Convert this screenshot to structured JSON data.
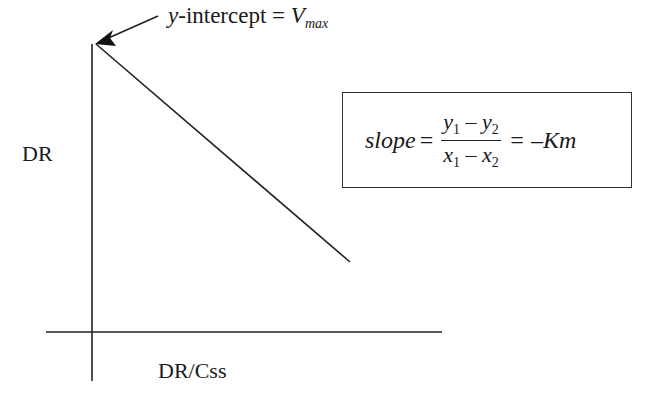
{
  "diagram": {
    "type": "linear-plot-sketch",
    "y_axis_label": "DR",
    "x_axis_label": "DR/Css",
    "annotation": {
      "prefix_var": "y",
      "text": "-intercept = ",
      "value_main": "V",
      "value_sub": "max"
    },
    "formula": {
      "lhs": "slope",
      "equals": "=",
      "num_a": "y",
      "num_a_sub": "1",
      "num_op": " – ",
      "num_b": "y",
      "num_b_sub": "2",
      "den_a": "x",
      "den_a_sub": "1",
      "den_op": " – ",
      "den_b": "x",
      "den_b_sub": "2",
      "rhs": "= –Km"
    },
    "line": {
      "x1": 96,
      "y1": 44,
      "x2": 350,
      "y2": 262
    },
    "stroke_color": "#222222"
  }
}
